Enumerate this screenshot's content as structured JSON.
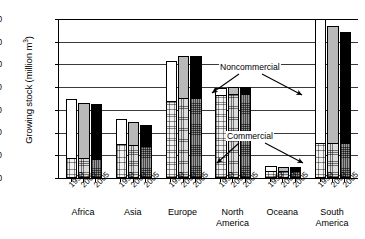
{
  "chart_data": {
    "type": "bar",
    "subtype": "stacked-grouped-column",
    "title": "",
    "xlabel": "",
    "ylabel": "Growing stock (million m",
    "ylabel_exponent": "3",
    "ylabel_suffix": ")",
    "ylabel_full": "Growing stock (million m3)",
    "ylim": [
      0,
      140000
    ],
    "ytick_values": [
      0,
      20000,
      40000,
      60000,
      80000,
      100000,
      120000,
      140000
    ],
    "ytick_labels": [
      "0",
      "20,000",
      "40,000",
      "60,000",
      "80,000",
      "100,000",
      "120,000",
      "140,000"
    ],
    "grid": true,
    "grid_axis": "y",
    "legend_position": "inline-annotations",
    "categories": [
      "Africa",
      "Asia",
      "Europe",
      "North America",
      "Oceana",
      "South America"
    ],
    "category_labels_wrapped": [
      [
        "Africa"
      ],
      [
        "Asia"
      ],
      [
        "Europe"
      ],
      [
        "North",
        "America"
      ],
      [
        "Oceana"
      ],
      [
        "South",
        "America"
      ]
    ],
    "years": [
      "1990",
      "2000",
      "2005"
    ],
    "stack_names": [
      "Commercial",
      "Noncommercial"
    ],
    "annotations": [
      {
        "text": "Noncommercial",
        "points_to": [
          "North America noncommercial segment",
          "South America noncommercial segment"
        ]
      },
      {
        "text": "Commercial",
        "points_to": [
          "Oceana commercial segment",
          "South America commercial segment"
        ]
      }
    ],
    "series": [
      {
        "name": "Commercial",
        "values": {
          "Africa": [
            17000,
            16500,
            16000
          ],
          "Asia": [
            29000,
            28000,
            27000
          ],
          "Europe": [
            67000,
            70000,
            70000
          ],
          "North America": [
            72000,
            73000,
            73000
          ],
          "Oceana": [
            5500,
            5000,
            5000
          ],
          "South America": [
            30000,
            30000,
            30000
          ]
        }
      },
      {
        "name": "Noncommercial",
        "values": {
          "Africa": [
            53000,
            49500,
            49000
          ],
          "Asia": [
            23000,
            21000,
            20000
          ],
          "Europe": [
            36000,
            37000,
            37000
          ],
          "North America": [
            7000,
            7000,
            7000
          ],
          "Oceana": [
            5500,
            5000,
            5000
          ],
          "South America": [
            110000,
            104000,
            99000
          ]
        }
      }
    ],
    "totals": {
      "Africa": [
        70000,
        66000,
        65000
      ],
      "Asia": [
        52000,
        49000,
        47000
      ],
      "Europe": [
        103000,
        107000,
        107000
      ],
      "North America": [
        79000,
        80000,
        80000
      ],
      "Oceana": [
        11000,
        10000,
        10000
      ],
      "South America": [
        140000,
        134000,
        129000
      ]
    },
    "bar_fill_legend": {
      "1990_noncommercial": "#ffffff",
      "2000_noncommercial": "#b9b9b9",
      "2005_noncommercial": "#000000",
      "1990_commercial": "#f2f2f2",
      "2000_commercial": "#dcdcdc",
      "2005_commercial": "#9a9a9a"
    }
  }
}
